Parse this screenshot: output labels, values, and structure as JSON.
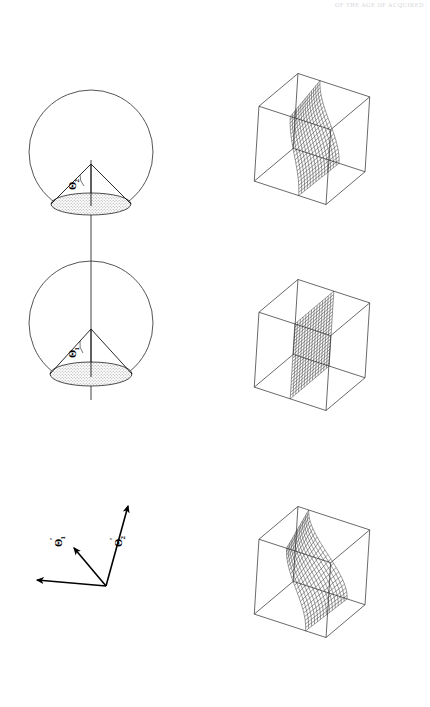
{
  "page": {
    "running_header": "OF THE AGE OF ACQUIRED",
    "background_color": "#ffffff",
    "ink_color": "#1a1a1a",
    "width": 430,
    "height": 707
  },
  "figure": {
    "orientation": "rotated-90",
    "caption": "",
    "panels": {
      "left_column_name": "parameter-cones",
      "right_column_name": "surface-boxes"
    }
  },
  "cones": [
    {
      "id": "cone-theta-2",
      "label": "Θ",
      "subscript": "2",
      "center_x": 91,
      "center_y": 152,
      "radius": 62,
      "apex_y": 164,
      "base_y": 204,
      "base_rx": 40,
      "base_ry": 11,
      "shade": "#d6d6d6"
    },
    {
      "id": "cone-theta-1",
      "label": "Θ",
      "subscript": "1",
      "center_x": 91,
      "center_y": 323,
      "radius": 62,
      "apex_y": 329,
      "base_y": 374,
      "base_rx": 41,
      "base_ry": 12,
      "shade": "#d6d6d6"
    }
  ],
  "axis_triad": {
    "id": "coordinate-triad",
    "origin_x": 106,
    "origin_y": 586,
    "arrows": [
      {
        "name": "axis-theta-2-prime",
        "tip_x": 128,
        "tip_y": 503,
        "label": "Θ",
        "subscript": "2",
        "prime": "′"
      },
      {
        "name": "axis-theta-1-prime",
        "tip_x": 72,
        "tip_y": 546,
        "label": "Θ",
        "subscript": "1",
        "prime": "′"
      },
      {
        "name": "axis-unlabeled",
        "tip_x": 33,
        "tip_y": 580,
        "label": "",
        "subscript": "",
        "prime": ""
      }
    ]
  },
  "boxes": [
    {
      "id": "surface-box-top",
      "name": "wireframe-box-1",
      "surface_type": "twisted-sheet",
      "cx": 312,
      "cy": 139,
      "mesh_rows": 22,
      "mesh_cols": 14,
      "curvature": 0.55
    },
    {
      "id": "surface-box-middle",
      "name": "wireframe-box-2",
      "surface_type": "planar-sheet",
      "cx": 312,
      "cy": 345,
      "mesh_rows": 22,
      "mesh_cols": 14,
      "curvature": 0.0
    },
    {
      "id": "surface-box-bottom",
      "name": "wireframe-box-3",
      "surface_type": "saddle-sheet",
      "cx": 312,
      "cy": 572,
      "mesh_rows": 22,
      "mesh_cols": 14,
      "curvature": 1.0
    }
  ]
}
